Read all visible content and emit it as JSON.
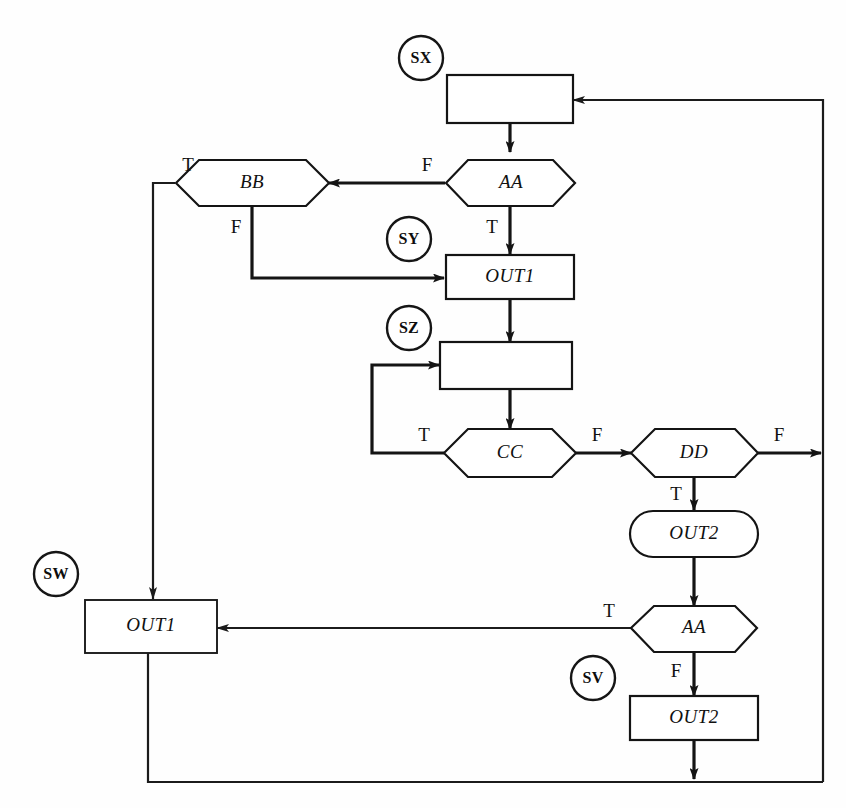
{
  "diagram": {
    "background_color": "#fefefe",
    "line_color": "#141414",
    "nodes": [
      {
        "id": "box_sx",
        "label": "",
        "shape": "rectangle"
      },
      {
        "id": "dec_aa1",
        "label": "AA",
        "shape": "hexagon"
      },
      {
        "id": "dec_bb",
        "label": "BB",
        "shape": "hexagon"
      },
      {
        "id": "box_out1_top",
        "label": "OUT1",
        "shape": "rectangle"
      },
      {
        "id": "box_sz",
        "label": "",
        "shape": "rectangle"
      },
      {
        "id": "dec_cc",
        "label": "CC",
        "shape": "hexagon"
      },
      {
        "id": "dec_dd",
        "label": "DD",
        "shape": "hexagon"
      },
      {
        "id": "term_out2",
        "label": "OUT2",
        "shape": "stadium"
      },
      {
        "id": "dec_aa2",
        "label": "AA",
        "shape": "hexagon"
      },
      {
        "id": "box_out2",
        "label": "OUT2",
        "shape": "rectangle"
      },
      {
        "id": "box_out1_sw",
        "label": "OUT1",
        "shape": "rectangle"
      }
    ],
    "tags": [
      {
        "id": "tag_sx",
        "label": "SX"
      },
      {
        "id": "tag_sy",
        "label": "SY"
      },
      {
        "id": "tag_sz",
        "label": "SZ"
      },
      {
        "id": "tag_sw",
        "label": "SW"
      },
      {
        "id": "tag_sv",
        "label": "SV"
      }
    ],
    "branch_labels": [
      {
        "id": "bb_true",
        "label": "T",
        "at": "bb-left"
      },
      {
        "id": "aa1_false",
        "label": "F",
        "at": "aa1-left"
      },
      {
        "id": "bb_false",
        "label": "F",
        "at": "bb-bottom"
      },
      {
        "id": "aa1_true",
        "label": "T",
        "at": "aa1-bottom"
      },
      {
        "id": "cc_true",
        "label": "T",
        "at": "cc-left"
      },
      {
        "id": "cc_false",
        "label": "F",
        "at": "cc-right"
      },
      {
        "id": "dd_false",
        "label": "F",
        "at": "dd-right"
      },
      {
        "id": "dd_true",
        "label": "T",
        "at": "dd-bottom"
      },
      {
        "id": "aa2_true",
        "label": "T",
        "at": "aa2-left"
      },
      {
        "id": "aa2_false",
        "label": "F",
        "at": "aa2-bottom"
      }
    ]
  }
}
